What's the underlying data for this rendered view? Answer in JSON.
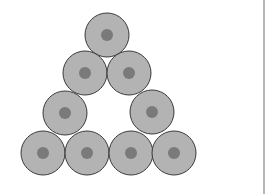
{
  "diagram": {
    "type": "triangular arrangement of circles",
    "circle_count": 9,
    "outer_radius": 22,
    "inner_radius": 6,
    "colors": {
      "background": "#ffffff",
      "circle_fill": "#b3b3b3",
      "circle_stroke": "#3a3a3a",
      "core_fill": "#7a7a7a",
      "divider": "#6e6e6e"
    },
    "circles": [
      {
        "row": 1,
        "cx": 107,
        "cy": 35
      },
      {
        "row": 2,
        "cx": 85,
        "cy": 73
      },
      {
        "row": 2,
        "cx": 129,
        "cy": 73
      },
      {
        "row": 3,
        "cx": 65,
        "cy": 113
      },
      {
        "row": 3,
        "cx": 152,
        "cy": 112
      },
      {
        "row": 4,
        "cx": 43,
        "cy": 153
      },
      {
        "row": 4,
        "cx": 87,
        "cy": 153
      },
      {
        "row": 4,
        "cx": 131,
        "cy": 153
      },
      {
        "row": 4,
        "cx": 174,
        "cy": 153
      }
    ],
    "divider_x": 264
  }
}
